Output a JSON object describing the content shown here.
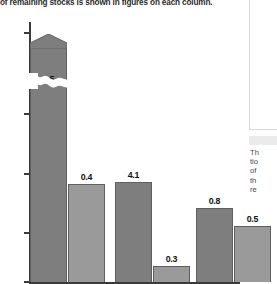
{
  "caption": {
    "text": "of remaining stocks is shown in figures on each column."
  },
  "side_panel": {
    "lines": [
      "Th",
      "tio",
      "of",
      "th",
      "re"
    ]
  },
  "colors": {
    "bar_dark": "#7e7e7e",
    "bar_light": "#9a9a9a",
    "bar_outline": "#5f5f5f",
    "axis": "#3a3a3a",
    "text": "#1d1d1d",
    "background": "#ffffff"
  },
  "chart_data": {
    "type": "bar",
    "title": "",
    "xlabel": "",
    "ylabel": "",
    "ylim": [
      0,
      5200
    ],
    "grid": false,
    "legend": null,
    "axis_break": {
      "present": true,
      "style": "wavy",
      "below": 3400,
      "above": 4600,
      "note": "Y axis is broken between 3,000 and 5,200; the first column extends off-scale and is capped with an arrow head."
    },
    "ytick_labels": [
      "0",
      "1,000",
      "2,000",
      "3,000",
      "5,200"
    ],
    "ytick_values": [
      0,
      1000,
      2000,
      3000,
      5200
    ],
    "categories": [
      "1",
      "2",
      "3",
      "4",
      "5",
      "6"
    ],
    "bars": [
      {
        "label": "1.5",
        "value": 1.5,
        "height": 5200,
        "series": "dark",
        "broken": true,
        "capped": true,
        "label_position": "inside"
      },
      {
        "label": "0.4",
        "value": 0.4,
        "height": 1640,
        "series": "light",
        "broken": false,
        "capped": false,
        "label_position": "above"
      },
      {
        "label": "4.1",
        "value": 4.1,
        "height": 1620,
        "series": "dark",
        "broken": false,
        "capped": false,
        "label_position": "above"
      },
      {
        "label": "0.3",
        "value": 0.3,
        "height": 170,
        "series": "light",
        "broken": false,
        "capped": false,
        "label_position": "above"
      },
      {
        "label": "0.8",
        "value": 0.8,
        "height": 980,
        "series": "dark",
        "broken": false,
        "capped": false,
        "label_position": "above"
      },
      {
        "label": "0.5",
        "value": 0.5,
        "height": 760,
        "series": "light",
        "broken": false,
        "capped": false,
        "label_position": "above"
      }
    ],
    "values": [
      1.5,
      0.4,
      4.1,
      0.3,
      0.8,
      0.5
    ],
    "annotation": "Figure on each column shows the value of remaining stocks."
  }
}
